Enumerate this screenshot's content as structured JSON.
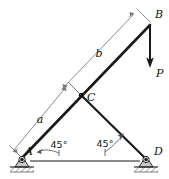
{
  "figure": {
    "background_color": "#ffffff",
    "line_color": "#1a1a1a",
    "dimension_color": "#6f6f6f"
  },
  "nodes": {
    "A": {
      "label": "A",
      "x": 22,
      "y": 158,
      "support": "pin"
    },
    "B": {
      "label": "B",
      "x": 150,
      "y": 22,
      "support": "free"
    },
    "C": {
      "label": "C",
      "x": 81,
      "y": 95,
      "support": "joint"
    },
    "D": {
      "label": "D",
      "x": 146,
      "y": 158,
      "support": "pin"
    }
  },
  "members": [
    {
      "name": "member-AB",
      "from": "A",
      "to": "B"
    },
    {
      "name": "member-CD",
      "from": "C",
      "to": "D"
    }
  ],
  "load": {
    "label": "P",
    "direction": "down",
    "applied_at": "B"
  },
  "dimensions": [
    {
      "name": "dimension-a",
      "label": "a",
      "from": "A",
      "to": "C"
    },
    {
      "name": "dimension-b",
      "label": "b",
      "from": "C",
      "to": "B"
    }
  ],
  "angles": [
    {
      "name": "angle-at-A",
      "label": "45°",
      "at": "A"
    },
    {
      "name": "angle-at-D",
      "label": "45°",
      "at": "D"
    }
  ],
  "icons": {
    "pin_support": "pin-support-icon",
    "ground_hatch": "ground-hatch-icon",
    "arrowhead": "arrowhead-icon"
  }
}
